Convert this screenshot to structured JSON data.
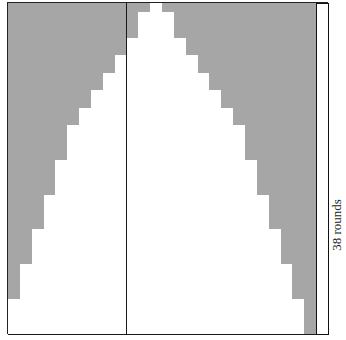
{
  "chart": {
    "columns": 27,
    "rows": 38,
    "cell_width": 11.85,
    "cell_height": 8.71,
    "shade_color": "#a6a6a6",
    "background_color": "#ffffff",
    "line_color": "#1a1a1a",
    "edge_column": 26,
    "white_spans": [
      [
        12,
        12
      ],
      [
        11,
        13
      ],
      [
        11,
        13
      ],
      [
        11,
        13
      ],
      [
        10,
        14
      ],
      [
        10,
        14
      ],
      [
        9,
        15
      ],
      [
        9,
        15
      ],
      [
        8,
        16
      ],
      [
        8,
        16
      ],
      [
        7,
        17
      ],
      [
        7,
        17
      ],
      [
        6,
        18
      ],
      [
        6,
        18
      ],
      [
        5,
        19
      ],
      [
        5,
        19
      ],
      [
        5,
        19
      ],
      [
        5,
        19
      ],
      [
        4,
        20
      ],
      [
        4,
        20
      ],
      [
        4,
        20
      ],
      [
        4,
        20
      ],
      [
        3,
        21
      ],
      [
        3,
        21
      ],
      [
        3,
        21
      ],
      [
        3,
        21
      ],
      [
        2,
        22
      ],
      [
        2,
        22
      ],
      [
        2,
        22
      ],
      [
        2,
        22
      ],
      [
        1,
        23
      ],
      [
        1,
        23
      ],
      [
        1,
        23
      ],
      [
        1,
        23
      ],
      [
        0,
        24
      ],
      [
        0,
        24
      ],
      [
        0,
        24
      ],
      [
        0,
        24
      ]
    ]
  },
  "labels": {
    "side": "38 rounds",
    "bottom": "stitches"
  }
}
